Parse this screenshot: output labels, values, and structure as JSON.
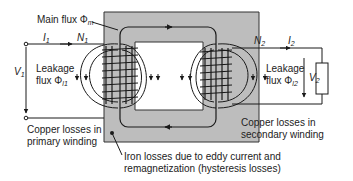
{
  "diagram": {
    "colors": {
      "core": "#bdbdbd",
      "core_border": "#333333",
      "line": "#1a1a1a",
      "background": "#ffffff"
    },
    "labels": {
      "main_flux": "Main flux Φ",
      "main_flux_sub": "m",
      "i1": "I",
      "i1_sub": "1",
      "n1": "N",
      "n1_sub": "1",
      "v1": "V",
      "v1_sub": "1",
      "leakage1_line1": "Leakage",
      "leakage1_line2": "flux Φ",
      "leakage1_sub": "l1",
      "copper_primary_line1": "Copper losses in",
      "copper_primary_line2": "primary winding",
      "n2": "N",
      "n2_sub": "2",
      "i2": "I",
      "i2_sub": "2",
      "v2": "V",
      "v2_sub": "2",
      "leakage2_line1": "Leakage",
      "leakage2_line2": "flux Φ",
      "leakage2_sub": "l2",
      "copper_secondary_line1": "Copper losses in",
      "copper_secondary_line2": "secondary winding",
      "iron_losses_line1": "Iron losses due to eddy current and",
      "iron_losses_line2": "remagnetization (hysteresis losses)"
    },
    "components": {
      "core": "iron-core",
      "primary_winding": "primary-winding",
      "secondary_winding": "secondary-winding",
      "load": "load-resistor"
    }
  }
}
